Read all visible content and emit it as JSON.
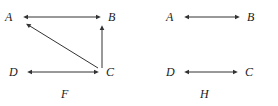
{
  "figures": [
    {
      "caption": "F",
      "caption_x": 61,
      "caption_y": 88,
      "nodes": [
        {
          "id": "A",
          "label": "A",
          "label_x": 5,
          "label_y": 11,
          "x": 22,
          "y": 17
        },
        {
          "id": "B",
          "label": "B",
          "label_x": 108,
          "label_y": 11,
          "x": 102,
          "y": 17
        },
        {
          "id": "D",
          "label": "D",
          "label_x": 9,
          "label_y": 66,
          "x": 26,
          "y": 72
        },
        {
          "id": "C",
          "label": "C",
          "label_x": 106,
          "label_y": 66,
          "x": 100,
          "y": 72
        }
      ],
      "edges": [
        {
          "from": "A",
          "to": "B",
          "kind": "bidirectional",
          "x1": 22,
          "y1": 17,
          "x2": 102,
          "y2": 17
        },
        {
          "from": "C",
          "to": "B",
          "kind": "directed",
          "x1": 102,
          "y1": 68,
          "x2": 102,
          "y2": 24
        },
        {
          "from": "C",
          "to": "A",
          "kind": "directed",
          "x1": 98,
          "y1": 68,
          "x2": 25,
          "y2": 23
        },
        {
          "from": "D",
          "to": "C",
          "kind": "bidirectional",
          "x1": 26,
          "y1": 72,
          "x2": 100,
          "y2": 72
        }
      ]
    },
    {
      "caption": "H",
      "caption_x": 61,
      "caption_y": 88,
      "nodes": [
        {
          "id": "A",
          "label": "A",
          "label_x": 27,
          "label_y": 11,
          "x": 44,
          "y": 17
        },
        {
          "id": "B",
          "label": "B",
          "label_x": 108,
          "label_y": 11,
          "x": 102,
          "y": 17
        },
        {
          "id": "D",
          "label": "D",
          "label_x": 27,
          "label_y": 66,
          "x": 44,
          "y": 72
        },
        {
          "id": "C",
          "label": "C",
          "label_x": 106,
          "label_y": 66,
          "x": 100,
          "y": 72
        }
      ],
      "edges": [
        {
          "from": "A",
          "to": "B",
          "kind": "bidirectional",
          "x1": 44,
          "y1": 17,
          "x2": 102,
          "y2": 17
        },
        {
          "from": "D",
          "to": "C",
          "kind": "bidirectional",
          "x1": 44,
          "y1": 72,
          "x2": 100,
          "y2": 72
        }
      ]
    }
  ],
  "style": {
    "line_color": "#333333",
    "background": "#ffffff",
    "stroke_width": 1
  }
}
